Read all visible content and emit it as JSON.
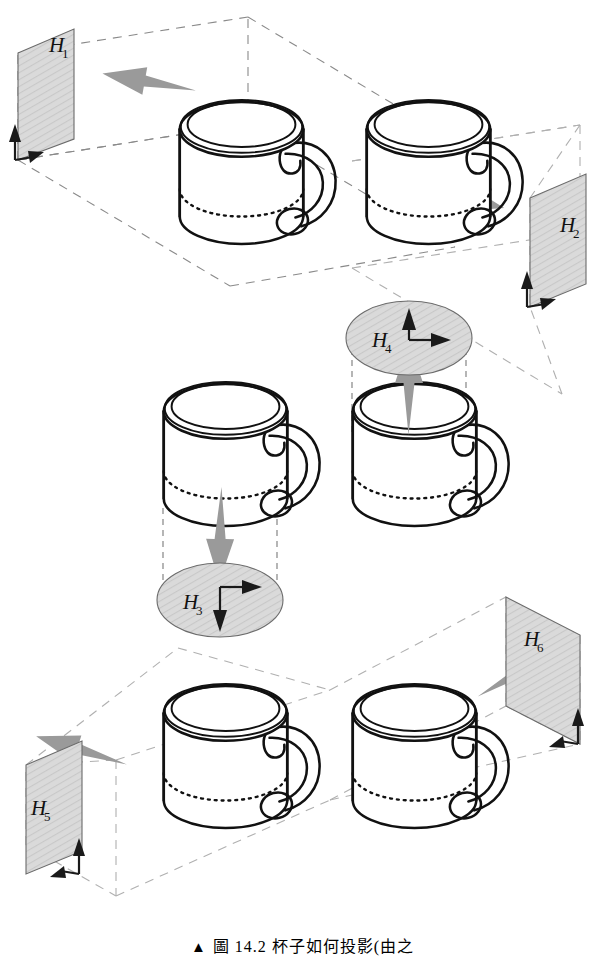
{
  "figure": {
    "caption_marker": "▲",
    "caption_text": "圖 14.2  杯子如何投影(由之",
    "object_name": "mug",
    "object_count": 6,
    "plane_count": 6
  },
  "style": {
    "plane_fill": "#d9d9d9",
    "plane_stroke": "#6b6b6b",
    "arrow_gray": "#9a9a9a",
    "ink": "#111111",
    "dash_gray": "#8a8a8a",
    "background": "#ffffff"
  },
  "views": [
    {
      "id": "view-1",
      "plane_label": "H",
      "plane_sub": "1",
      "plane_shape": "parallelogram",
      "plane_position": "left",
      "projection_direction": "left",
      "axes": [
        "up",
        "right"
      ]
    },
    {
      "id": "view-2",
      "plane_label": "H",
      "plane_sub": "2",
      "plane_shape": "parallelogram",
      "plane_position": "right",
      "projection_direction": "right",
      "axes": [
        "up",
        "right"
      ]
    },
    {
      "id": "view-3",
      "plane_label": "H",
      "plane_sub": "3",
      "plane_shape": "ellipse",
      "plane_position": "below",
      "projection_direction": "down",
      "axes": [
        "right",
        "down"
      ]
    },
    {
      "id": "view-4",
      "plane_label": "H",
      "plane_sub": "4",
      "plane_shape": "ellipse",
      "plane_position": "above",
      "projection_direction": "up",
      "axes": [
        "up",
        "right"
      ]
    },
    {
      "id": "view-5",
      "plane_label": "H",
      "plane_sub": "5",
      "plane_shape": "parallelogram",
      "plane_position": "left",
      "projection_direction": "left",
      "axes": [
        "up",
        "right"
      ]
    },
    {
      "id": "view-6",
      "plane_label": "H",
      "plane_sub": "6",
      "plane_shape": "parallelogram",
      "plane_position": "right",
      "projection_direction": "upper-right",
      "axes": [
        "up",
        "right"
      ]
    }
  ]
}
